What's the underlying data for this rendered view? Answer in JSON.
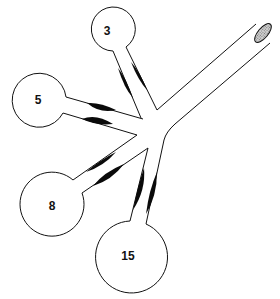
{
  "diagram": {
    "type": "branching airway with alveoli (balloons) of different sizes",
    "colors": {
      "stroke": "#111111",
      "constriction": "#0a0a0a",
      "end_hatch": "#9a9a9a",
      "background": "#ffffff"
    },
    "trunk": {
      "label": "",
      "open_end": "hatched ellipse"
    },
    "alveoli": [
      {
        "label": "3",
        "cx": 107,
        "cy": 30,
        "r": 22
      },
      {
        "label": "5",
        "cx": 38,
        "cy": 100,
        "r": 27
      },
      {
        "label": "8",
        "cx": 52,
        "cy": 205,
        "r": 32
      },
      {
        "label": "15",
        "cx": 128,
        "cy": 260,
        "r": 36
      }
    ]
  }
}
